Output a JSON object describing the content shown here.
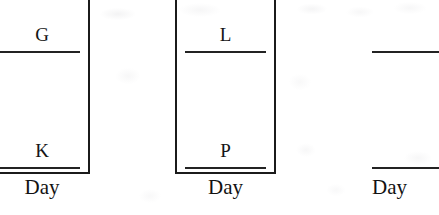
{
  "figure": {
    "kind": "scanned-figure-fragment",
    "ink_color": "#1b1b1b",
    "paper_color": "#ffffff"
  },
  "panels": [
    {
      "id": "panel-left",
      "upper_label": "G",
      "lower_label": "K",
      "axis_label": "Day",
      "box_visible": true,
      "cropped_edge": "left"
    },
    {
      "id": "panel-mid",
      "upper_label": "L",
      "lower_label": "P",
      "axis_label": "Day",
      "box_visible": true,
      "cropped_edge": "none"
    },
    {
      "id": "panel-right",
      "upper_label": "",
      "lower_label": "",
      "axis_label": "Day",
      "box_visible": false,
      "cropped_edge": "right"
    }
  ],
  "chart_data": {
    "type": "bar",
    "title": "",
    "xlabel": "Day",
    "ylabel": "",
    "grid": false,
    "legend": null,
    "note": "Three cropped panels of a multi-panel figure. Each panel is a tall rectangular plot frame (top cut off by the crop) containing two horizontal reference rules with single-letter series labels above them.",
    "panels": [
      {
        "name": "panel-left",
        "xlabel": "Day",
        "categories": [
          "G",
          "K"
        ],
        "values": [
          1,
          2
        ],
        "annotations": [
          "G",
          "K"
        ],
        "rule_y_px": [
          51,
          167
        ]
      },
      {
        "name": "panel-mid",
        "xlabel": "Day",
        "categories": [
          "L",
          "P"
        ],
        "values": [
          1,
          2
        ],
        "annotations": [
          "L",
          "P"
        ],
        "rule_y_px": [
          51,
          167
        ]
      },
      {
        "name": "panel-right",
        "xlabel": "Day",
        "categories": [
          "",
          ""
        ],
        "values": [
          1,
          2
        ],
        "annotations": [],
        "rule_y_px": [
          51,
          167
        ]
      }
    ]
  }
}
